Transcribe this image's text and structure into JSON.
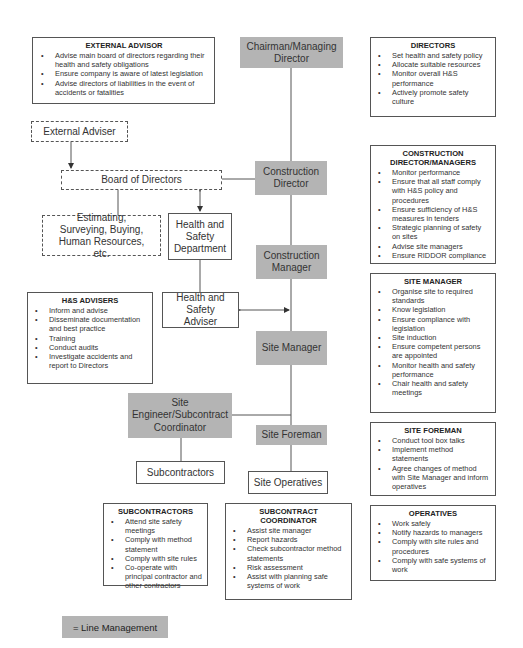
{
  "diagram": {
    "nodes": {
      "chairman": "Chairman/Managing Director",
      "external_adviser": "External Adviser",
      "board_of_directors": "Board of Directors",
      "construction_director": "Construction Director",
      "estimating": "Estimating, Surveying, Buying, Human Resources, etc.",
      "hs_department": "Health and Safety Department",
      "construction_manager": "Construction Manager",
      "hs_adviser": "Health and Safety Adviser",
      "site_manager": "Site Manager",
      "site_engineer": "Site Engineer/Subcontract Coordinator",
      "site_foreman": "Site Foreman",
      "subcontractors": "Subcontractors",
      "site_operatives": "Site Operatives"
    },
    "info_boxes": {
      "external_advisor": {
        "title": "EXTERNAL ADVISOR",
        "items": [
          "Advise main board of directors regarding their health and safety obligations",
          "Ensure company is aware of latest legislation",
          "Advise directors of liabilities in the event of accidents or fatalities"
        ]
      },
      "directors": {
        "title": "DIRECTORS",
        "items": [
          "Set health and safety policy",
          "Allocate suitable resources",
          "Monitor overall H&S performance",
          "Actively promote safety culture"
        ]
      },
      "construction_directors": {
        "title": "CONSTRUCTION DIRECTOR/MANAGERS",
        "items": [
          "Monitor performance",
          "Ensure that all staff comply with H&S policy and procedures",
          "Ensure sufficiency of H&S measures in tenders",
          "Strategic planning of safety on sites",
          "Advise site managers",
          "Ensure RIDDOR compliance"
        ]
      },
      "hs_advisers": {
        "title": "H&S ADVISERS",
        "items": [
          "Inform and advise",
          "Disseminate documentation and best practice",
          "Training",
          "Conduct audits",
          "Investigate accidents and report to Directors"
        ]
      },
      "site_manager": {
        "title": "SITE MANAGER",
        "items": [
          "Organise site to required standards",
          "Know legislation",
          "Ensure compliance with legislation",
          "Site induction",
          "Ensure competent persons are appointed",
          "Monitor health and safety performance",
          "Chair health and safety meetings"
        ]
      },
      "site_foreman": {
        "title": "SITE FOREMAN",
        "items": [
          "Conduct tool box talks",
          "Implement method statements",
          "Agree changes of method with Site Manager and inform operatives"
        ]
      },
      "subcontractors": {
        "title": "SUBCONTRACTORS",
        "items": [
          "Attend site safety meetings",
          "Comply with method statement",
          "Comply with site rules",
          "Co-operate with principal contractor and other contractors"
        ]
      },
      "subcontract_coordinator": {
        "title": "SUBCONTRACT COORDINATOR",
        "items": [
          "Assist site manager",
          "Report hazards",
          "Check subcontractor method statements",
          "Risk assessment",
          "Assist with planning safe systems of work"
        ]
      },
      "operatives": {
        "title": "OPERATIVES",
        "items": [
          "Work safely",
          "Notify hazards to managers",
          "Comply with site rules and procedures",
          "Comply with safe systems of work"
        ]
      }
    },
    "legend": {
      "label": "= Line Management",
      "swatch_color": "#b4b4b4"
    }
  }
}
